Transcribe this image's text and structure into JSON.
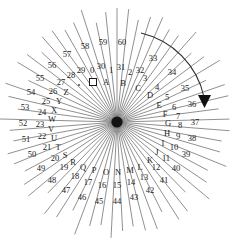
{
  "figure": {
    "background_color": "#ffffff",
    "ray_color": "#6b6b6b",
    "text_color": "#1b1b1b",
    "hub_color": "#141414",
    "width": 234,
    "height": 244,
    "center": {
      "x": 117,
      "y": 122
    },
    "ray_count": 61
  },
  "chart_data": {
    "type": "scatter",
    "xlabel": "",
    "ylabel": "",
    "center": {
      "x": 117,
      "y": 122
    },
    "ray_count": 61,
    "rings": [
      "inner-numbers",
      "letters",
      "outer-numbers"
    ],
    "labels": [
      {
        "text": "0",
        "ring": "inner",
        "x": 92,
        "y": 70
      },
      {
        "text": "1",
        "ring": "inner",
        "x": 111,
        "y": 70
      },
      {
        "text": "2",
        "ring": "inner",
        "x": 130,
        "y": 72
      },
      {
        "text": "3",
        "ring": "inner",
        "x": 145,
        "y": 78
      },
      {
        "text": "4",
        "ring": "inner",
        "x": 157,
        "y": 87
      },
      {
        "text": "5",
        "ring": "inner",
        "x": 167,
        "y": 97
      },
      {
        "text": "6",
        "ring": "inner",
        "x": 174,
        "y": 107
      },
      {
        "text": "7",
        "ring": "inner",
        "x": 178,
        "y": 116
      },
      {
        "text": "8",
        "ring": "inner",
        "x": 180,
        "y": 125
      },
      {
        "text": "9",
        "ring": "inner",
        "x": 178,
        "y": 136
      },
      {
        "text": "10",
        "ring": "inner",
        "x": 174,
        "y": 147
      },
      {
        "text": "11",
        "ring": "inner",
        "x": 166,
        "y": 158
      },
      {
        "text": "12",
        "ring": "inner",
        "x": 156,
        "y": 167
      },
      {
        "text": "13",
        "ring": "inner",
        "x": 144,
        "y": 177
      },
      {
        "text": "14",
        "ring": "inner",
        "x": 131,
        "y": 182
      },
      {
        "text": "15",
        "ring": "inner",
        "x": 117,
        "y": 185
      },
      {
        "text": "16",
        "ring": "inner",
        "x": 102,
        "y": 185
      },
      {
        "text": "17",
        "ring": "inner",
        "x": 88,
        "y": 182
      },
      {
        "text": "18",
        "ring": "inner",
        "x": 75,
        "y": 176
      },
      {
        "text": "19",
        "ring": "inner",
        "x": 64,
        "y": 167
      },
      {
        "text": "20",
        "ring": "inner",
        "x": 55,
        "y": 158
      },
      {
        "text": "21",
        "ring": "inner",
        "x": 47,
        "y": 147
      },
      {
        "text": "22",
        "ring": "inner",
        "x": 42,
        "y": 136
      },
      {
        "text": "23",
        "ring": "inner",
        "x": 40,
        "y": 124
      },
      {
        "text": "24",
        "ring": "inner",
        "x": 42,
        "y": 112
      },
      {
        "text": "25",
        "ring": "inner",
        "x": 46,
        "y": 101
      },
      {
        "text": "26",
        "ring": "inner",
        "x": 53,
        "y": 91
      },
      {
        "text": "27",
        "ring": "inner",
        "x": 61,
        "y": 82
      },
      {
        "text": "28",
        "ring": "inner",
        "x": 71,
        "y": 75
      },
      {
        "text": "29",
        "ring": "inner",
        "x": 81,
        "y": 70
      },
      {
        "text": "30",
        "ring": "inner",
        "x": 101,
        "y": 66
      },
      {
        "text": "31",
        "ring": "inner",
        "x": 121,
        "y": 67
      },
      {
        "text": "32",
        "ring": "inner",
        "x": 140,
        "y": 70
      },
      {
        "text": "A",
        "ring": "letter",
        "x": 106,
        "y": 82
      },
      {
        "text": "B",
        "ring": "letter",
        "x": 123,
        "y": 83
      },
      {
        "text": "C",
        "ring": "letter",
        "x": 138,
        "y": 88
      },
      {
        "text": "D",
        "ring": "letter",
        "x": 150,
        "y": 95
      },
      {
        "text": "E",
        "ring": "letter",
        "x": 159,
        "y": 105
      },
      {
        "text": "F",
        "ring": "letter",
        "x": 165,
        "y": 114
      },
      {
        "text": "G",
        "ring": "letter",
        "x": 168,
        "y": 123
      },
      {
        "text": "H",
        "ring": "letter",
        "x": 167,
        "y": 133
      },
      {
        "text": "I",
        "ring": "letter",
        "x": 163,
        "y": 143
      },
      {
        "text": "J",
        "ring": "letter",
        "x": 157,
        "y": 152
      },
      {
        "text": "K",
        "ring": "letter",
        "x": 150,
        "y": 160
      },
      {
        "text": "L",
        "ring": "letter",
        "x": 140,
        "y": 167
      },
      {
        "text": "M",
        "ring": "letter",
        "x": 130,
        "y": 170
      },
      {
        "text": "N",
        "ring": "letter",
        "x": 118,
        "y": 172
      },
      {
        "text": "O",
        "ring": "letter",
        "x": 106,
        "y": 172
      },
      {
        "text": "P",
        "ring": "letter",
        "x": 94,
        "y": 170
      },
      {
        "text": "Q",
        "ring": "letter",
        "x": 83,
        "y": 167
      },
      {
        "text": "R",
        "ring": "letter",
        "x": 73,
        "y": 162
      },
      {
        "text": "S",
        "ring": "letter",
        "x": 65,
        "y": 155
      },
      {
        "text": "T",
        "ring": "letter",
        "x": 58,
        "y": 147
      },
      {
        "text": "U",
        "ring": "letter",
        "x": 54,
        "y": 138
      },
      {
        "text": "V",
        "ring": "letter",
        "x": 51,
        "y": 129
      },
      {
        "text": "W",
        "ring": "letter",
        "x": 52,
        "y": 119
      },
      {
        "text": "X",
        "ring": "letter",
        "x": 54,
        "y": 110
      },
      {
        "text": "Y",
        "ring": "letter",
        "x": 59,
        "y": 101
      },
      {
        "text": "Z",
        "ring": "letter",
        "x": 66,
        "y": 92
      },
      {
        "text": "33",
        "ring": "outer",
        "x": 153,
        "y": 58
      },
      {
        "text": "34",
        "ring": "outer",
        "x": 172,
        "y": 72
      },
      {
        "text": "35",
        "ring": "outer",
        "x": 185,
        "y": 88
      },
      {
        "text": "36",
        "ring": "outer",
        "x": 192,
        "y": 104
      },
      {
        "text": "37",
        "ring": "outer",
        "x": 195,
        "y": 122
      },
      {
        "text": "38",
        "ring": "outer",
        "x": 192,
        "y": 138
      },
      {
        "text": "39",
        "ring": "outer",
        "x": 186,
        "y": 154
      },
      {
        "text": "40",
        "ring": "outer",
        "x": 176,
        "y": 168
      },
      {
        "text": "41",
        "ring": "outer",
        "x": 164,
        "y": 180
      },
      {
        "text": "42",
        "ring": "outer",
        "x": 150,
        "y": 190
      },
      {
        "text": "43",
        "ring": "outer",
        "x": 134,
        "y": 197
      },
      {
        "text": "44",
        "ring": "outer",
        "x": 117,
        "y": 201
      },
      {
        "text": "45",
        "ring": "outer",
        "x": 99,
        "y": 201
      },
      {
        "text": "46",
        "ring": "outer",
        "x": 82,
        "y": 197
      },
      {
        "text": "47",
        "ring": "outer",
        "x": 66,
        "y": 190
      },
      {
        "text": "48",
        "ring": "outer",
        "x": 52,
        "y": 180
      },
      {
        "text": "49",
        "ring": "outer",
        "x": 41,
        "y": 168
      },
      {
        "text": "50",
        "ring": "outer",
        "x": 32,
        "y": 154
      },
      {
        "text": "51",
        "ring": "outer",
        "x": 26,
        "y": 139
      },
      {
        "text": "52",
        "ring": "outer",
        "x": 23,
        "y": 123
      },
      {
        "text": "53",
        "ring": "outer",
        "x": 25,
        "y": 107
      },
      {
        "text": "54",
        "ring": "outer",
        "x": 31,
        "y": 92
      },
      {
        "text": "55",
        "ring": "outer",
        "x": 40,
        "y": 78
      },
      {
        "text": "56",
        "ring": "outer",
        "x": 52,
        "y": 65
      },
      {
        "text": "57",
        "ring": "outer",
        "x": 67,
        "y": 54
      },
      {
        "text": "58",
        "ring": "outer",
        "x": 85,
        "y": 46
      },
      {
        "text": "59",
        "ring": "outer",
        "x": 103,
        "y": 42
      },
      {
        "text": "60",
        "ring": "outer",
        "x": 122,
        "y": 42
      }
    ],
    "markers": [
      {
        "name": "square-marker",
        "shape": "square",
        "x": 93,
        "y": 82
      },
      {
        "name": "dot-marker",
        "shape": "dot",
        "x": 79,
        "y": 85
      }
    ],
    "annotations": [
      {
        "name": "clockwise-arc-arrow",
        "type": "curved-arrow",
        "direction": "clockwise",
        "quadrant": "upper-right"
      }
    ]
  }
}
